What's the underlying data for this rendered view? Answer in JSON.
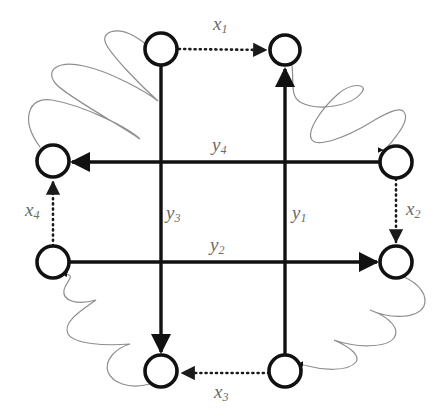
{
  "figure": {
    "type": "directed-graph-diagram",
    "width": 447,
    "height": 417,
    "background": "#ffffff"
  },
  "styles": {
    "node_stroke": "#111111",
    "node_fill": "#ffffff",
    "solid_edge_color": "#111111",
    "dotted_edge_color": "#1a1a1a",
    "squiggle_color": "#8e8e8c",
    "label_color": "#6a6a68"
  },
  "nodes": [
    {
      "id": "n-top-left",
      "name": "node-top-left",
      "cx": 161,
      "cy": 49,
      "r": 16
    },
    {
      "id": "n-top-right",
      "name": "node-top-right",
      "cx": 285,
      "cy": 50,
      "r": 15
    },
    {
      "id": "n-left-upper",
      "name": "node-left-upper",
      "cx": 53,
      "cy": 161,
      "r": 16
    },
    {
      "id": "n-right-upper",
      "name": "node-right-upper",
      "cx": 396,
      "cy": 162,
      "r": 16
    },
    {
      "id": "n-left-lower",
      "name": "node-left-lower",
      "cx": 53,
      "cy": 262,
      "r": 16
    },
    {
      "id": "n-right-lower",
      "name": "node-right-lower",
      "cx": 396,
      "cy": 262,
      "r": 16
    },
    {
      "id": "n-bottom-left",
      "name": "node-bottom-left",
      "cx": 161,
      "cy": 371,
      "r": 16
    },
    {
      "id": "n-bottom-right",
      "name": "node-bottom-right",
      "cx": 285,
      "cy": 371,
      "r": 16
    }
  ],
  "edges": {
    "solid": [
      {
        "id": "y1",
        "name": "edge-y1",
        "label": "y",
        "subscript": "1",
        "from": "n-bottom-right",
        "to": "n-top-right",
        "orientation": "vertical",
        "direction": "up",
        "x1": 285,
        "y1": 355,
        "x2": 285,
        "y2": 66
      },
      {
        "id": "y2",
        "name": "edge-y2",
        "label": "y",
        "subscript": "2",
        "from": "n-left-lower",
        "to": "n-right-lower",
        "orientation": "horizontal",
        "direction": "right",
        "x1": 69,
        "y1": 262,
        "x2": 380,
        "y2": 262
      },
      {
        "id": "y3",
        "name": "edge-y3",
        "label": "y",
        "subscript": "3",
        "from": "n-top-left",
        "to": "n-bottom-left",
        "orientation": "vertical",
        "direction": "down",
        "x1": 161,
        "y1": 65,
        "x2": 161,
        "y2": 355
      },
      {
        "id": "y4",
        "name": "edge-y4",
        "label": "y",
        "subscript": "4",
        "from": "n-right-upper",
        "to": "n-left-upper",
        "orientation": "horizontal",
        "direction": "left",
        "x1": 380,
        "y1": 162,
        "x2": 69,
        "y2": 162
      }
    ],
    "dotted": [
      {
        "id": "x1",
        "name": "edge-x1",
        "label": "x",
        "subscript": "1",
        "from": "n-top-left",
        "to": "n-top-right",
        "orientation": "horizontal",
        "direction": "right",
        "x1": 178,
        "y1": 49,
        "x2": 270,
        "y2": 50
      },
      {
        "id": "x2",
        "name": "edge-x2",
        "label": "x",
        "subscript": "2",
        "from": "n-right-upper",
        "to": "n-right-lower",
        "orientation": "vertical",
        "direction": "down",
        "x1": 396,
        "y1": 178,
        "x2": 396,
        "y2": 246
      },
      {
        "id": "x3",
        "name": "edge-x3",
        "label": "x",
        "subscript": "3",
        "from": "n-bottom-right",
        "to": "n-bottom-left",
        "orientation": "horizontal",
        "direction": "left",
        "x1": 269,
        "y1": 373,
        "x2": 178,
        "y2": 373
      },
      {
        "id": "x4",
        "name": "edge-x4",
        "label": "x",
        "subscript": "4",
        "from": "n-left-lower",
        "to": "n-left-upper",
        "orientation": "vertical",
        "direction": "up",
        "x1": 53,
        "y1": 246,
        "x2": 53,
        "y2": 178
      }
    ],
    "squiggles": [
      {
        "id": "sq-top-left",
        "name": "squiggle-top-left",
        "from": "n-left-upper",
        "to": "n-top-left"
      },
      {
        "id": "sq-top-right",
        "name": "squiggle-top-right",
        "from": "n-top-right",
        "to": "n-right-upper"
      },
      {
        "id": "sq-bottom-left",
        "name": "squiggle-bottom-left",
        "from": "n-bottom-left",
        "to": "n-left-lower"
      },
      {
        "id": "sq-bottom-right",
        "name": "squiggle-bottom-right",
        "from": "n-right-lower",
        "to": "n-bottom-right"
      }
    ]
  },
  "labels": [
    {
      "id": "lbl-x1",
      "name": "label-x1",
      "base": "x",
      "sub": "1",
      "x": 213,
      "y": 30
    },
    {
      "id": "lbl-x2",
      "name": "label-x2",
      "base": "x",
      "sub": "2",
      "x": 406,
      "y": 215
    },
    {
      "id": "lbl-x3",
      "name": "label-x3",
      "base": "x",
      "sub": "3",
      "x": 214,
      "y": 398
    },
    {
      "id": "lbl-x4",
      "name": "label-x4",
      "base": "x",
      "sub": "4",
      "x": 25,
      "y": 216
    },
    {
      "id": "lbl-y1",
      "name": "label-y1",
      "base": "y",
      "sub": "1",
      "x": 292,
      "y": 219
    },
    {
      "id": "lbl-y2",
      "name": "label-y2",
      "base": "y",
      "sub": "2",
      "x": 210,
      "y": 251
    },
    {
      "id": "lbl-y3",
      "name": "label-y3",
      "base": "y",
      "sub": "3",
      "x": 166,
      "y": 219
    },
    {
      "id": "lbl-y4",
      "name": "label-y4",
      "base": "y",
      "sub": "4",
      "x": 212,
      "y": 151
    }
  ]
}
